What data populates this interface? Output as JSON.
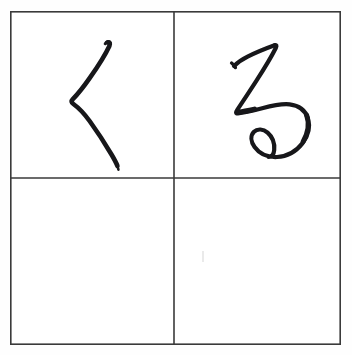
{
  "worksheet": {
    "title": "Hiragana handwriting practice grid",
    "script": "Hiragana",
    "background_color": "#fefefe",
    "ink_color": "#17171a",
    "grid_line_color": "#3a3a3a",
    "rows": 2,
    "columns": 2
  },
  "grid": {
    "border_label": "outer grid border",
    "divider_vertical_label": "vertical center divider",
    "divider_horizontal_label": "horizontal center divider",
    "outer_bounds": {
      "left": 10,
      "top": 11,
      "width": 331,
      "height": 334
    },
    "divider_x": 164,
    "divider_y": 167
  },
  "cells": [
    {
      "position": "top-left",
      "row": 1,
      "column": 1,
      "filled": true,
      "character": "く",
      "romaji": "ku",
      "stroke_count": 1,
      "description": "single angled stroke bending leftward at the middle"
    },
    {
      "position": "top-right",
      "row": 1,
      "column": 2,
      "filled": true,
      "character": "る",
      "romaji": "ru",
      "stroke_count": 1,
      "description": "horizontal entry, diagonal descent, curved body closing in a small bottom loop"
    },
    {
      "position": "bottom-left",
      "row": 2,
      "column": 1,
      "filled": false,
      "character": "",
      "romaji": "",
      "stroke_count": 0,
      "description": "empty practice cell"
    },
    {
      "position": "bottom-right",
      "row": 2,
      "column": 2,
      "filled": false,
      "character": "",
      "romaji": "",
      "stroke_count": 0,
      "description": "empty practice cell"
    }
  ]
}
